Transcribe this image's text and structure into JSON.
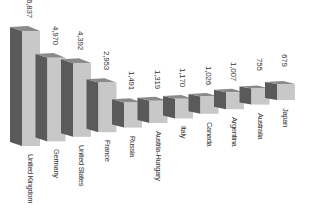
{
  "chart_data": {
    "type": "bar",
    "style": "3d",
    "title": "",
    "xlabel": "",
    "ylabel": "",
    "categories": [
      "United Kingdom",
      "Germany",
      "United States",
      "France",
      "Russia",
      "Austria-Hungary",
      "Italy",
      "Canada",
      "Argentina",
      "Australia",
      "Japan"
    ],
    "values": [
      6837,
      4970,
      4392,
      2953,
      1491,
      1319,
      1170,
      1026,
      1007,
      755,
      679
    ],
    "value_labels": [
      "6,837",
      "4,970",
      "4,392",
      "2,953",
      "1,491",
      "1,319",
      "1,170",
      "1,026",
      "1,007",
      "755",
      "679"
    ],
    "grid": false,
    "legend": false,
    "colors": {
      "front": "#c8c8c8",
      "side": "#5a5a5a",
      "top": "#8a8a8a",
      "text": "#333333"
    }
  }
}
